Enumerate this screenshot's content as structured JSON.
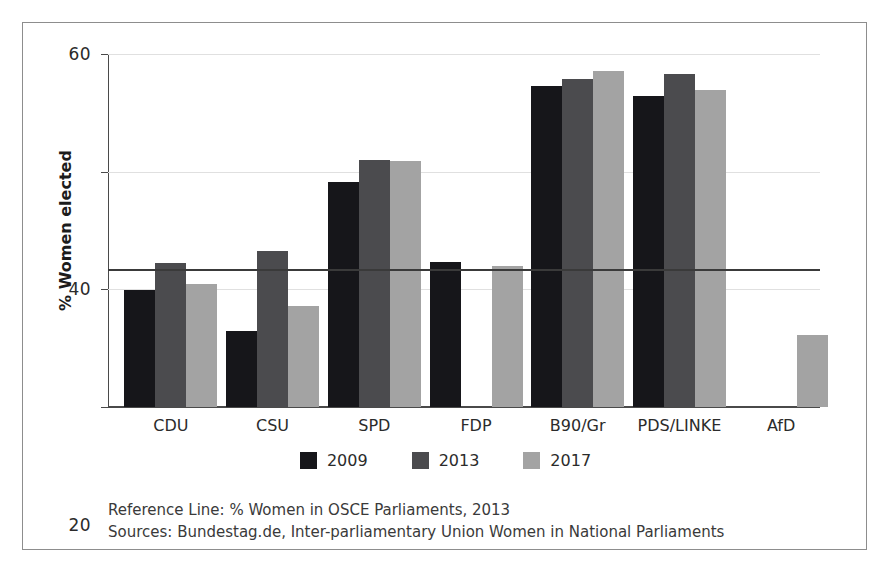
{
  "chart_data": {
    "type": "bar",
    "title": "",
    "xlabel": "",
    "ylabel": "% Women elected",
    "ylim": [
      0,
      60
    ],
    "yticks": [
      0,
      20,
      40,
      60
    ],
    "grid": true,
    "legend_position": "bottom-center",
    "categories": [
      "CDU",
      "CSU",
      "SPD",
      "FDP",
      "B90/Gr",
      "PDS/LINKE",
      "AfD"
    ],
    "series": [
      {
        "name": "2009",
        "color": "#16161a",
        "values": [
          19.9,
          13.0,
          38.3,
          24.6,
          54.6,
          52.9,
          0
        ]
      },
      {
        "name": "2013",
        "color": "#4b4b4e",
        "values": [
          24.4,
          26.5,
          42.0,
          0,
          55.8,
          56.6,
          0
        ]
      },
      {
        "name": "2017",
        "color": "#a3a3a3",
        "values": [
          20.9,
          17.1,
          41.8,
          23.9,
          57.1,
          53.9,
          12.2
        ]
      }
    ],
    "reference_line": {
      "value": 23.4,
      "label": "Reference Line: % Women in OSCE Parliaments, 2013",
      "color": "#3a3a3a"
    },
    "annotations": {
      "sources": "Sources: Bundestag.de, Inter-parliamentary Union Women in National Parliaments"
    }
  },
  "axis": {
    "y_title": "% Women elected",
    "y_tick_labels": [
      "60",
      "40",
      "20",
      "0"
    ],
    "x_tick_labels": [
      "CDU",
      "CSU",
      "SPD",
      "FDP",
      "B90/Gr",
      "PDS/LINKE",
      "AfD"
    ]
  },
  "legend": {
    "items": [
      {
        "label": "2009",
        "color": "#16161a"
      },
      {
        "label": "2013",
        "color": "#4b4b4e"
      },
      {
        "label": "2017",
        "color": "#a3a3a3"
      }
    ]
  },
  "footnotes": {
    "reference": "Reference Line: % Women in OSCE Parliaments, 2013",
    "sources": "Sources: Bundestag.de, Inter-parliamentary Union Women in National Parliaments"
  }
}
